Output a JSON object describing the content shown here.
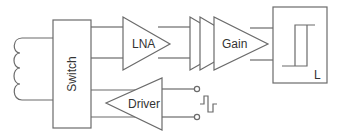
{
  "diagram": {
    "type": "block-diagram",
    "blocks": {
      "switch": {
        "label": "Switch"
      },
      "lna": {
        "label": "LNA"
      },
      "gain": {
        "label": "Gain"
      },
      "limiter": {
        "label": "L"
      },
      "driver": {
        "label": "Driver"
      }
    },
    "elements": [
      "coil-antenna",
      "switch",
      "lna-amplifier",
      "cascaded-gain-stages",
      "gain-amplifier",
      "hysteresis-comparator-L",
      "driver-amplifier",
      "input-terminals",
      "pulse-signal"
    ],
    "colors": {
      "line": "#6b6b6b",
      "text": "#333333",
      "background": "#ffffff"
    }
  }
}
